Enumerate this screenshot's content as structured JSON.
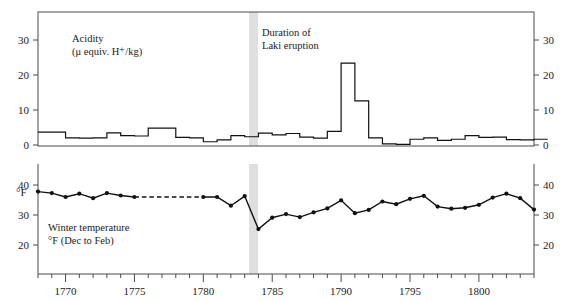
{
  "chart_data": [
    {
      "type": "line",
      "panel": "acidity",
      "title": "Acidity",
      "subtitle": "(μ equiv. H⁺/kg)",
      "xlabel": "",
      "ylabel": "Acidity (μ equiv. H+/kg)",
      "drawstyle": "steps",
      "xlim": [
        1768,
        1804
      ],
      "ylim": [
        0,
        37
      ],
      "yticks": [
        0,
        10,
        20,
        30
      ],
      "ytick_labels": [
        "0",
        "10",
        "20",
        "30"
      ],
      "yaxis_right_mirrored": true,
      "grid": false,
      "legend": "none",
      "annotation": "Duration of Laki eruption",
      "x": [
        1768,
        1769,
        1770,
        1771,
        1772,
        1773,
        1774,
        1775,
        1776,
        1777,
        1778,
        1779,
        1780,
        1781,
        1782,
        1783,
        1784,
        1785,
        1786,
        1787,
        1788,
        1789,
        1790,
        1791,
        1792,
        1793,
        1794,
        1795,
        1796,
        1797,
        1798,
        1799,
        1800,
        1801,
        1802,
        1803,
        1804
      ],
      "values": [
        3.6,
        3.6,
        2.0,
        1.9,
        2.0,
        3.4,
        2.6,
        2.5,
        4.7,
        4.7,
        2.1,
        2.0,
        0.9,
        1.4,
        2.6,
        2.3,
        3.3,
        2.8,
        3.2,
        2.2,
        1.9,
        3.8,
        22.8,
        12.3,
        2.0,
        0.3,
        0.2,
        1.6,
        2.0,
        1.3,
        1.6,
        2.6,
        2.1,
        2.2,
        1.5,
        1.4,
        1.6
      ],
      "series_note": "stepped acidity record from ice core, one step per year"
    },
    {
      "type": "line",
      "panel": "winter_temperature",
      "title": "Winter temperature",
      "subtitle": "°F (Dec to Feb)",
      "xlabel": "",
      "ylabel": "°F",
      "xlim": [
        1768,
        1804
      ],
      "ylim": [
        15,
        44
      ],
      "yticks": [
        20,
        30,
        40
      ],
      "ytick_labels": [
        "20",
        "30",
        "40"
      ],
      "yaxis_right_mirrored": true,
      "grid": false,
      "legend": "none",
      "markers": true,
      "gap_dashed_between": [
        1775,
        1780
      ],
      "x": [
        1768,
        1769,
        1770,
        1771,
        1772,
        1773,
        1774,
        1775,
        1780,
        1781,
        1782,
        1783,
        1784,
        1785,
        1786,
        1787,
        1788,
        1789,
        1790,
        1791,
        1792,
        1793,
        1794,
        1795,
        1796,
        1797,
        1798,
        1799,
        1800,
        1801,
        1802,
        1803,
        1804
      ],
      "values": [
        37.8,
        37.3,
        36.0,
        37.1,
        35.6,
        37.3,
        36.5,
        36.0,
        36.0,
        36.0,
        33.1,
        36.3,
        25.3,
        29.1,
        30.3,
        29.3,
        30.9,
        32.2,
        34.9,
        30.6,
        31.7,
        34.5,
        33.6,
        35.4,
        36.4,
        32.8,
        32.1,
        32.4,
        33.4,
        35.8,
        37.1,
        35.6,
        31.8
      ]
    }
  ],
  "axis": {
    "x_major_ticks": [
      1770,
      1775,
      1780,
      1785,
      1790,
      1795,
      1800
    ],
    "x_major_labels": [
      "1770",
      "1775",
      "1780",
      "1785",
      "1790",
      "1795",
      "1800"
    ],
    "x_minor_step": 1,
    "x_start": 1768,
    "x_end": 1804
  },
  "acidity_panel": {
    "label_line1": "Acidity",
    "label_line2": "(μ equiv. H⁺/kg)",
    "eruption_line1": "Duration of",
    "eruption_line2": "Laki eruption",
    "y_labels_left": [
      "30",
      "20",
      "10",
      "0"
    ],
    "y_labels_right": [
      "30",
      "20",
      "10",
      "0"
    ]
  },
  "temperature_panel": {
    "axis_label": "°F",
    "caption_line1": "Winter temperature",
    "caption_line2": "°F (Dec to Feb)",
    "y_labels_left": [
      "40",
      "30",
      "20"
    ],
    "y_labels_right": [
      "40",
      "30",
      "20"
    ]
  },
  "colors": {
    "line": "#111111",
    "frame": "#4a4a4a",
    "eruption_band": "#d9d9d9",
    "background": "#ffffff"
  }
}
